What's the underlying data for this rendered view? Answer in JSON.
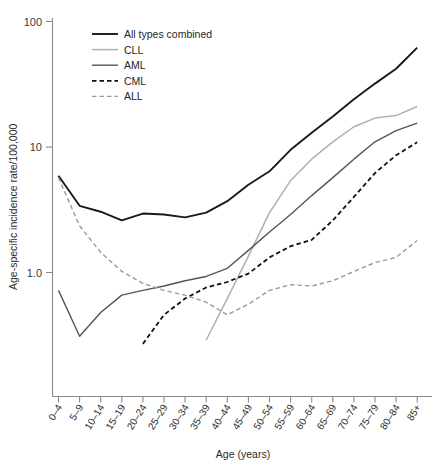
{
  "chart_data": {
    "type": "line",
    "title": "",
    "xlabel": "Age (years)",
    "ylabel": "Age-specific incidence rate/100,000",
    "yscale": "log",
    "ylim": [
      0.2,
      100
    ],
    "ytick_labels": [
      "100",
      "10",
      "1.0"
    ],
    "ytick_values": [
      100,
      10,
      1.0
    ],
    "grid": false,
    "legend_position": "top-left",
    "categories": [
      "0–4",
      "5–9",
      "10–14",
      "15–19",
      "20–24",
      "25–29",
      "30–34",
      "35–39",
      "40–44",
      "45–49",
      "50–54",
      "55–59",
      "60–64",
      "65–69",
      "70–74",
      "75–79",
      "80–84",
      "85+"
    ],
    "series": [
      {
        "name": "All types combined",
        "color": "#1a1a1a",
        "width": 1.9,
        "dash": "none",
        "values": [
          5.9,
          3.4,
          3.05,
          2.6,
          2.95,
          2.9,
          2.75,
          3.0,
          3.7,
          5.0,
          6.4,
          9.5,
          13.0,
          17.5,
          24.0,
          32.0,
          42.0,
          62.0
        ]
      },
      {
        "name": "CLL",
        "color": "#b0b0b0",
        "width": 1.5,
        "dash": "none",
        "values": [
          null,
          null,
          null,
          null,
          null,
          null,
          null,
          0.29,
          0.62,
          1.35,
          3.0,
          5.4,
          8.0,
          11.0,
          14.5,
          17.0,
          17.8,
          21.0
        ]
      },
      {
        "name": "AML",
        "color": "#555555",
        "width": 1.4,
        "dash": "none",
        "values": [
          0.72,
          0.31,
          0.48,
          0.66,
          0.72,
          0.78,
          0.86,
          0.93,
          1.08,
          1.5,
          2.1,
          2.9,
          4.1,
          5.7,
          8.0,
          11.0,
          13.5,
          15.5
        ]
      },
      {
        "name": "CML",
        "color": "#111111",
        "width": 1.8,
        "dash": "dashed",
        "values": [
          null,
          null,
          null,
          null,
          0.27,
          0.46,
          0.62,
          0.76,
          0.84,
          0.98,
          1.32,
          1.62,
          1.82,
          2.6,
          4.0,
          6.2,
          8.6,
          10.9
        ]
      },
      {
        "name": "ALL",
        "color": "#999999",
        "width": 1.4,
        "dash": "dashed",
        "values": [
          5.7,
          2.35,
          1.45,
          1.02,
          0.82,
          0.72,
          0.66,
          0.58,
          0.46,
          0.56,
          0.72,
          0.8,
          0.78,
          0.86,
          1.02,
          1.2,
          1.32,
          1.8
        ]
      }
    ]
  },
  "legend": {
    "items": [
      {
        "label": "All types combined"
      },
      {
        "label": "CLL"
      },
      {
        "label": "AML"
      },
      {
        "label": "CML"
      },
      {
        "label": "ALL"
      }
    ]
  }
}
